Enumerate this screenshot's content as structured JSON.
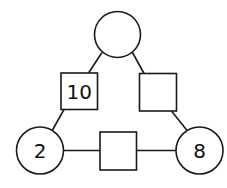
{
  "diagram": {
    "stroke_color": "#1a1a1a",
    "background": "#ffffff",
    "nodes": {
      "top_circle": {
        "shape": "circle",
        "cx": 117.5,
        "cy": 34.5,
        "r": 23,
        "value": ""
      },
      "left_circle": {
        "shape": "circle",
        "cx": 40,
        "cy": 150.5,
        "r": 23.5,
        "value": "2"
      },
      "right_circle": {
        "shape": "circle",
        "cx": 199.5,
        "cy": 150.5,
        "r": 23.5,
        "value": "8"
      },
      "left_square": {
        "shape": "square",
        "x": 61,
        "y": 73,
        "w": 36.5,
        "h": 36.5,
        "value": "10"
      },
      "right_square": {
        "shape": "square",
        "x": 139.5,
        "y": 73.5,
        "w": 37,
        "h": 37.5,
        "value": ""
      },
      "bottom_square": {
        "shape": "square",
        "x": 100,
        "y": 132,
        "w": 36.5,
        "h": 38,
        "value": ""
      }
    },
    "edges": [
      {
        "from": "top_circle",
        "to": "left_square",
        "x1": 102,
        "y1": 52.5,
        "x2": 88.5,
        "y2": 73
      },
      {
        "from": "top_circle",
        "to": "right_square",
        "x1": 132.5,
        "y1": 52.5,
        "x2": 144,
        "y2": 73.5
      },
      {
        "from": "left_square",
        "to": "left_circle",
        "x1": 64,
        "y1": 109.5,
        "x2": 52.5,
        "y2": 130
      },
      {
        "from": "right_square",
        "to": "right_circle",
        "x1": 171.5,
        "y1": 111,
        "x2": 187.5,
        "y2": 131
      },
      {
        "from": "left_circle",
        "to": "bottom_square",
        "x1": 63.5,
        "y1": 150.5,
        "x2": 100,
        "y2": 150.5
      },
      {
        "from": "bottom_square",
        "to": "right_circle",
        "x1": 136.5,
        "y1": 150.5,
        "x2": 176,
        "y2": 150.5
      }
    ]
  }
}
